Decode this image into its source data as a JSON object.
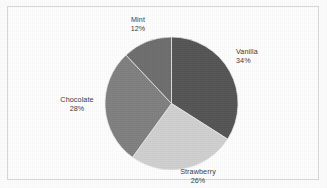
{
  "chart_data": {
    "type": "pie",
    "title": "",
    "labels": [
      "Vanilla",
      "Strawberry",
      "Chocolate",
      "Mint"
    ],
    "values": [
      34,
      26,
      28,
      12
    ],
    "value_suffix": "%",
    "start_angle_deg": 0,
    "direction": "clockwise",
    "legend": "none",
    "label_position": "outside",
    "grid": false,
    "slices": [
      {
        "label": "Vanilla",
        "value": 34,
        "display_value": "34%",
        "color": "#555555"
      },
      {
        "label": "Strawberry",
        "value": 26,
        "display_value": "26%",
        "color": "#d0d0d0"
      },
      {
        "label": "Chocolate",
        "value": 28,
        "display_value": "28%",
        "color": "#808080"
      },
      {
        "label": "Mint",
        "value": 12,
        "display_value": "12%",
        "color": "#6e6e6e"
      }
    ]
  },
  "figure": {
    "background_color": "#fdfdfd",
    "border_color": "#d8d8d8",
    "text_color": "#3a3a3a"
  }
}
